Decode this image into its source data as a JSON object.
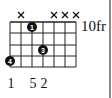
{
  "chord": {
    "strings": 7,
    "frets_shown": 4,
    "fret_position_label": "10fr",
    "muted_strings": [
      2,
      5,
      6,
      7
    ],
    "dots": [
      {
        "string": 1,
        "fret": 4,
        "finger": "4"
      },
      {
        "string": 3,
        "fret": 1,
        "finger": "1"
      },
      {
        "string": 4,
        "fret": 3,
        "finger": "3"
      }
    ],
    "bottom_labels": [
      {
        "string": 1,
        "text": "1"
      },
      {
        "string": 3,
        "text": "5"
      },
      {
        "string": 4,
        "text": "2"
      }
    ]
  },
  "labels": {
    "fret": "10fr",
    "b1": "1",
    "b3": "5",
    "b4": "2",
    "d1": "4",
    "d2": "1",
    "d3": "3"
  },
  "colors": {
    "grid": "#222222",
    "dot": "#111111",
    "border": "#8a8a8a"
  }
}
